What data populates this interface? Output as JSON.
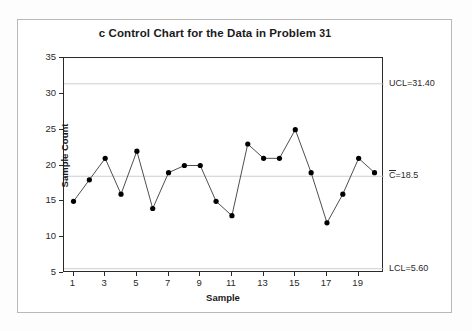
{
  "chart_data": {
    "type": "line",
    "title": "c Control Chart for the Data in Problem 31",
    "xlabel": "Sample",
    "ylabel": "Sample Count",
    "x": [
      1,
      2,
      3,
      4,
      5,
      6,
      7,
      8,
      9,
      10,
      11,
      12,
      13,
      14,
      15,
      16,
      17,
      18,
      19,
      20
    ],
    "values": [
      15,
      18,
      21,
      16,
      22,
      14,
      19,
      20,
      20,
      15,
      13,
      23,
      21,
      21,
      25,
      19,
      12,
      16,
      21,
      19
    ],
    "series": [
      {
        "name": "Sample Count",
        "values": [
          15,
          18,
          21,
          16,
          22,
          14,
          19,
          20,
          20,
          15,
          13,
          23,
          21,
          21,
          25,
          19,
          12,
          16,
          21,
          19
        ]
      }
    ],
    "xlim": [
      0.4,
      20.6
    ],
    "ylim": [
      5,
      35
    ],
    "y_ticks": [
      5,
      10,
      15,
      20,
      25,
      30,
      35
    ],
    "y_tick_labels": [
      "5",
      "10",
      "15",
      "20",
      "25",
      "30",
      "35"
    ],
    "x_ticks": [
      1,
      3,
      5,
      7,
      9,
      11,
      13,
      15,
      17,
      19
    ],
    "x_tick_labels": [
      "1",
      "3",
      "5",
      "7",
      "9",
      "11",
      "13",
      "15",
      "17",
      "19"
    ],
    "grid": false,
    "legend": "none",
    "marker": "filled-circle",
    "line_color": "#3a3a3a",
    "marker_color": "#000000",
    "limit_line_color": "#c8c8c8",
    "control_limits": {
      "ucl": 31.4,
      "center": 18.5,
      "lcl": 5.6,
      "ucl_label": "UCL=31.40",
      "center_label_prefix": "C",
      "center_label_suffix": "=18.5",
      "lcl_label": "LCL=5.60"
    },
    "annotations": [
      {
        "name": "ucl-annotation",
        "text": "UCL=31.40",
        "value": 31.4
      },
      {
        "name": "center-line-annotation",
        "text": "C=18.5",
        "value": 18.5
      },
      {
        "name": "lcl-annotation",
        "text": "LCL=5.60",
        "value": 5.6
      }
    ]
  },
  "title": {
    "prefix": "c Control Chart for the Data in Problem ",
    "number": "31",
    "full": "c Control Chart for the Data in Problem 31"
  },
  "axes": {
    "y_label": "Sample Count",
    "x_label": "Sample",
    "y_ticks": [
      "35",
      "30",
      "25",
      "20",
      "15",
      "10",
      "5"
    ],
    "x_ticks": [
      "1",
      "3",
      "5",
      "7",
      "9",
      "11",
      "13",
      "15",
      "17",
      "19"
    ]
  },
  "limits": {
    "ucl_text": "UCL=31.40",
    "center_prefix": "C",
    "center_rest": "=18.5",
    "lcl_text": "LCL=5.60"
  }
}
